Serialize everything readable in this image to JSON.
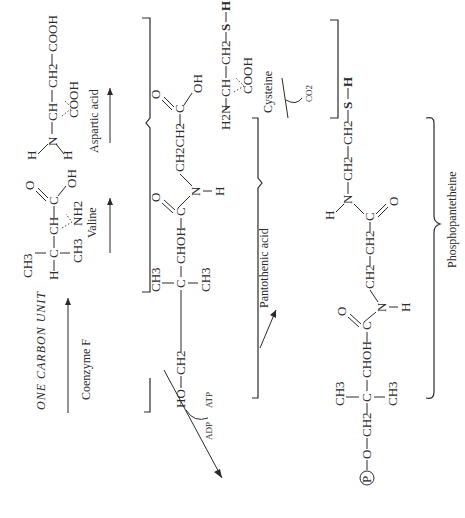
{
  "title": "ONE CARBON UNIT",
  "precursors": {
    "one_carbon": {
      "reagent": "Coenzyme F"
    },
    "valine": {
      "name": "Valine",
      "groups": [
        "H",
        "C",
        "CH3",
        "CH3",
        "CH",
        "NH2",
        "C",
        "O",
        "OH"
      ]
    },
    "aspartic": {
      "name": "Aspartic acid",
      "groups": [
        "H",
        "H",
        "N",
        "CH",
        "CH2",
        "COOH",
        "COOH"
      ]
    },
    "cysteine": {
      "name": "Cysteine",
      "groups": [
        "H2N",
        "CH",
        "CH2",
        "S",
        "H",
        "COOH"
      ],
      "byproduct": "CO2"
    }
  },
  "pantothenic": {
    "label": "Pantothenic acid",
    "text": {
      "ho": "HO",
      "ch2": "CH2",
      "c": "C",
      "ch3a": "CH3",
      "ch3b": "CH3",
      "choh": "CHOH",
      "c2": "C",
      "o": "O",
      "n": "N",
      "h": "H",
      "ch2ch2": "CH2CH2",
      "c3": "C",
      "o2": "O",
      "oh": "OH"
    }
  },
  "phosphorylation": {
    "in": "ATP",
    "out": "ADP"
  },
  "product": {
    "label": "Phosphopantetheine",
    "text": {
      "p": "P",
      "o": "O",
      "ch2": "CH2",
      "c": "C",
      "ch3a": "CH3",
      "ch3b": "CH3",
      "choh": "CHOH",
      "c2": "C",
      "o2": "O",
      "n": "N",
      "h": "H",
      "ch2a": "CH2",
      "ch2b": "CH2",
      "c3": "C",
      "o3": "O",
      "n2": "N",
      "h2": "H",
      "ch2c": "CH2",
      "ch2d": "CH2",
      "s": "S",
      "h3": "H"
    }
  }
}
